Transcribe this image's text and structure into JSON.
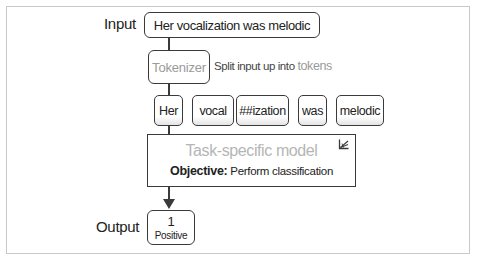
{
  "diagram": {
    "input": {
      "label": "Input",
      "text": "Her vocalization was melodic"
    },
    "tokenizer": {
      "label": "Tokenizer",
      "note_prefix": "Split input up into",
      "note_highlight": "tokens"
    },
    "tokens": [
      {
        "text": "Her"
      },
      {
        "text": "vocal"
      },
      {
        "text": "##ization"
      },
      {
        "text": "was"
      },
      {
        "text": "melodic"
      }
    ],
    "model": {
      "title": "Task-specific model",
      "objective_label": "Objective:",
      "objective_text": "Perform classification",
      "icon": "trainable-adjust-icon"
    },
    "output": {
      "label": "Output",
      "value": "1",
      "class_label": "Positive"
    },
    "colors": {
      "border": "#3a3a3a",
      "muted_text": "#9a9a9a",
      "model_title": "#b5b5b5",
      "frame": "#c8c8c8"
    }
  }
}
